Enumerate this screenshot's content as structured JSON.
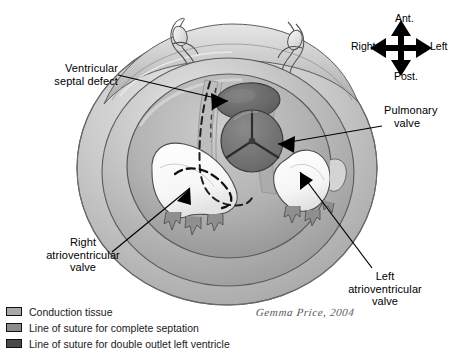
{
  "figure": {
    "type": "anatomical-illustration"
  },
  "compass": {
    "anterior": "Ant.",
    "posterior": "Post.",
    "left": "Left",
    "right": "Right"
  },
  "labels": {
    "vsd": {
      "line1": "Ventricular",
      "line2": "septal defect"
    },
    "pulmonary_valve": {
      "line1": "Pulmonary",
      "line2": "valve"
    },
    "right_av_valve": {
      "line1": "Right",
      "line2": "atrioventricular",
      "line3": "valve"
    },
    "left_av_valve": {
      "line1": "Left",
      "line2": "atrioventricular",
      "line3": "valve"
    }
  },
  "legend": {
    "items": [
      {
        "label": "Conduction tissue",
        "color": "#a8a8a8"
      },
      {
        "label": "Line of suture for complete septation",
        "color": "#8c8c8c"
      },
      {
        "label": "Line of suture for double outlet left ventricle",
        "color": "#4a4a4a"
      }
    ]
  },
  "signature": {
    "text": "Gemma Price, 2004"
  },
  "palette": {
    "myocardium_outer": "#b7b7b7",
    "myocardium_mid": "#c9c9c9",
    "myocardium_highlight": "#e2e2e2",
    "cavity_floor": "#a2a2a2",
    "vsd_fill": "#6f6f6f",
    "pulmonary_valve_fill": "#787878",
    "leaflet_white": "#fbfbfb",
    "line_black": "#000000",
    "background": "#ffffff"
  }
}
